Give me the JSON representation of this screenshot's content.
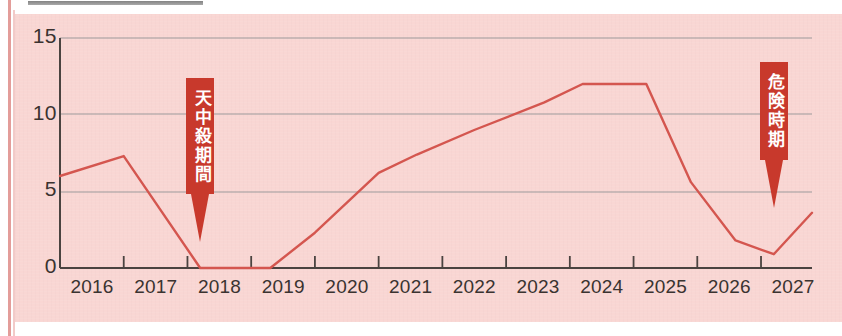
{
  "chart_data": {
    "type": "line",
    "title": "",
    "subtitle": "",
    "xlabel": "",
    "ylabel": "",
    "xlim": [
      2016,
      2027.8
    ],
    "ylim": [
      0,
      15
    ],
    "grid": true,
    "legend": false,
    "y_ticks": [
      "15",
      "10",
      "5",
      "0"
    ],
    "y_tick_values": [
      15,
      10,
      5,
      0
    ],
    "categories": [
      "2016",
      "2017",
      "2018",
      "2019",
      "2020",
      "2021",
      "2022",
      "2023",
      "2024",
      "2025",
      "2026",
      "2027"
    ],
    "series": [
      {
        "name": "運勢",
        "color": "#d4564f",
        "x": [
          2016.0,
          2017.0,
          2018.2,
          2019.3,
          2020.0,
          2021.0,
          2021.6,
          2022.5,
          2023.6,
          2024.2,
          2025.2,
          2025.9,
          2026.6,
          2027.2,
          2027.8
        ],
        "values": [
          6.0,
          7.3,
          0.0,
          0.0,
          2.3,
          6.2,
          7.4,
          9.0,
          10.8,
          12.0,
          12.0,
          5.6,
          1.8,
          0.9,
          3.6
        ]
      }
    ],
    "annotations": [
      {
        "label": "天中殺期間",
        "text_vertical": [
          "天",
          "中",
          "殺",
          "期",
          "間"
        ],
        "color": "#c8392c",
        "text_color": "#ffffff",
        "points_to_x": 2018.2,
        "points_to_y": 0
      },
      {
        "label": "危険時期",
        "text_vertical": [
          "危",
          "険",
          "時",
          "期"
        ],
        "color": "#c8392c",
        "text_color": "#ffffff",
        "points_to_x": 2027.2,
        "points_to_y": 0.9
      }
    ]
  },
  "style": {
    "panel_background": "#f9d6d3",
    "page_background": "#ffffff",
    "axis_color": "#4a4340",
    "grid_color": "#8d8f93",
    "line_color": "#d4564f",
    "tick_label_color": "#3a3330",
    "accent_red": "#c8392c",
    "margin_rule_color": "#e0928f"
  }
}
